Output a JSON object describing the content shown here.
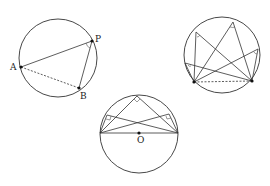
{
  "figure": {
    "diagram_1": {
      "labels": {
        "A": "A",
        "P": "P",
        "B": "B"
      },
      "circle": {
        "cx": 58,
        "cy": 58,
        "r": 39
      },
      "points": {
        "A": [
          21,
          67
        ],
        "P": [
          92,
          41
        ],
        "B": [
          79,
          88
        ]
      },
      "segments": [
        {
          "from": "A",
          "to": "P",
          "style": "solid"
        },
        {
          "from": "P",
          "to": "B",
          "style": "solid"
        },
        {
          "from": "A",
          "to": "B",
          "style": "dashed"
        }
      ],
      "angle_mark_at": "P"
    },
    "diagram_2": {
      "circle": {
        "cx": 222,
        "cy": 55,
        "r": 38
      },
      "chord_endpoints": {
        "left": [
          194,
          82
        ],
        "right": [
          252,
          81
        ]
      },
      "chord_style": "dashed",
      "arc_points": [
        [
          233,
          22
        ],
        [
          196,
          32
        ],
        [
          258,
          49
        ],
        [
          185,
          63
        ],
        [
          188,
          70
        ]
      ],
      "angle_marks": "equal inscribed angles"
    },
    "diagram_3": {
      "labels": {
        "O": "O"
      },
      "circle": {
        "cx": 139,
        "cy": 134,
        "r": 39
      },
      "diameter": {
        "left": [
          100,
          133
        ],
        "right": [
          178,
          133
        ]
      },
      "center_dot": [
        139,
        133
      ],
      "arc_points": [
        [
          137,
          96
        ],
        [
          107,
          115
        ],
        [
          169,
          114
        ]
      ],
      "angle_marks": "right angles"
    }
  }
}
